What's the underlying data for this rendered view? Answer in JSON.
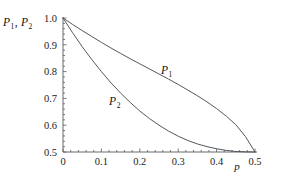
{
  "chart_data": {
    "type": "line",
    "title": "",
    "subtitle": "",
    "xlabel": "p",
    "ylabel": "P1, P2",
    "ylabel_display": "P",
    "ylabel_sub1": "1",
    "ylabel_sep": ", ",
    "ylabel_display2": "P",
    "ylabel_sub2": "2",
    "xlim": [
      0,
      0.5
    ],
    "ylim": [
      0.5,
      1.0
    ],
    "grid": false,
    "legend_position": "inline-labels",
    "xticks": [
      0,
      0.1,
      0.2,
      0.3,
      0.4,
      0.5
    ],
    "xticklabels": [
      "0",
      "0.1",
      "0.2",
      "0.3",
      "0.4",
      "0.5"
    ],
    "yticks": [
      0.5,
      0.6,
      0.7,
      0.8,
      0.9,
      1.0
    ],
    "yticklabels": [
      "0.5",
      "0.6",
      "0.7",
      "0.8",
      "0.9",
      "1.0"
    ],
    "x": [
      0,
      0.025,
      0.05,
      0.075,
      0.1,
      0.125,
      0.15,
      0.175,
      0.2,
      0.225,
      0.25,
      0.275,
      0.3,
      0.325,
      0.35,
      0.375,
      0.4,
      0.425,
      0.45,
      0.475,
      0.5
    ],
    "series": [
      {
        "name": "P1",
        "label": "P",
        "sublabel": "1",
        "color": "#4a4f54",
        "values": [
          1.0,
          0.976,
          0.953,
          0.931,
          0.909,
          0.888,
          0.868,
          0.848,
          0.829,
          0.81,
          0.791,
          0.772,
          0.752,
          0.731,
          0.71,
          0.687,
          0.662,
          0.634,
          0.602,
          0.558,
          0.5
        ]
      },
      {
        "name": "P2",
        "label": "P",
        "sublabel": "2",
        "color": "#4a4f54",
        "values": [
          1.0,
          0.945,
          0.893,
          0.845,
          0.8,
          0.758,
          0.72,
          0.685,
          0.653,
          0.625,
          0.6,
          0.578,
          0.559,
          0.543,
          0.53,
          0.52,
          0.512,
          0.506,
          0.502,
          0.5005,
          0.5
        ]
      }
    ],
    "annotations": [
      {
        "name": "P1-curve-label",
        "text": "P",
        "sub": "1",
        "x": 0.255,
        "y": 0.79
      },
      {
        "name": "P2-curve-label",
        "text": "P",
        "sub": "2",
        "x": 0.12,
        "y": 0.675
      }
    ]
  }
}
